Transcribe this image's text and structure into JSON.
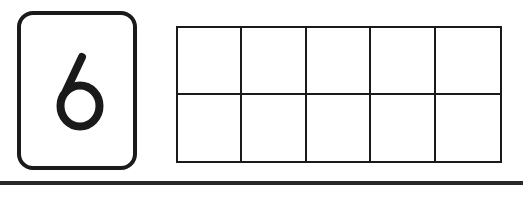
{
  "number_card": {
    "digit": "6"
  },
  "ten_frame": {
    "rows": 2,
    "columns": 5,
    "filled_cells": 0,
    "cells": [
      {
        "row": 1,
        "col": 1,
        "filled": false
      },
      {
        "row": 1,
        "col": 2,
        "filled": false
      },
      {
        "row": 1,
        "col": 3,
        "filled": false
      },
      {
        "row": 1,
        "col": 4,
        "filled": false
      },
      {
        "row": 1,
        "col": 5,
        "filled": false
      },
      {
        "row": 2,
        "col": 1,
        "filled": false
      },
      {
        "row": 2,
        "col": 2,
        "filled": false
      },
      {
        "row": 2,
        "col": 3,
        "filled": false
      },
      {
        "row": 2,
        "col": 4,
        "filled": false
      },
      {
        "row": 2,
        "col": 5,
        "filled": false
      }
    ]
  },
  "colors": {
    "ink": "#1a1a1a",
    "paper": "#ffffff"
  }
}
